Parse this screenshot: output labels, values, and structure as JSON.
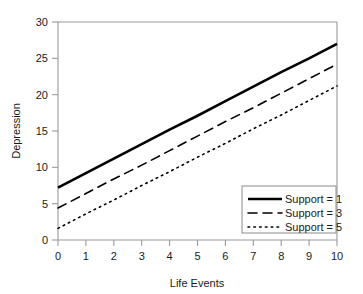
{
  "chart_data": {
    "type": "line",
    "title": "",
    "xlabel": "Life Events",
    "ylabel": "Depression",
    "x": [
      0,
      1,
      2,
      3,
      4,
      5,
      6,
      7,
      8,
      9,
      10
    ],
    "xlim": [
      0,
      10
    ],
    "ylim": [
      0,
      30
    ],
    "xticks": [
      "0",
      "1",
      "2",
      "3",
      "4",
      "5",
      "6",
      "7",
      "8",
      "9",
      "10"
    ],
    "yticks": [
      "0",
      "5",
      "10",
      "15",
      "20",
      "25",
      "30"
    ],
    "grid": false,
    "legend_position": "lower-right",
    "series": [
      {
        "name": "Support = 1",
        "style": "solid",
        "color": "#000000",
        "width": 2.6,
        "values": [
          7.2,
          9.2,
          11.2,
          13.2,
          15.2,
          17.1,
          19.1,
          21.1,
          23.1,
          25.0,
          27.0
        ]
      },
      {
        "name": "Support = 3",
        "style": "dashed",
        "color": "#000000",
        "width": 1.6,
        "values": [
          4.4,
          6.4,
          8.4,
          10.3,
          12.3,
          14.3,
          16.3,
          18.2,
          20.2,
          22.2,
          24.2
        ]
      },
      {
        "name": "Support = 5",
        "style": "dotted",
        "color": "#000000",
        "width": 1.6,
        "values": [
          1.6,
          3.6,
          5.5,
          7.5,
          9.4,
          11.4,
          13.3,
          15.3,
          17.2,
          19.2,
          21.2
        ]
      }
    ]
  },
  "axes": {
    "x_title": "Life Events",
    "y_title": "Depression",
    "x_tick_labels": [
      "0",
      "1",
      "2",
      "3",
      "4",
      "5",
      "6",
      "7",
      "8",
      "9",
      "10"
    ],
    "y_tick_labels": [
      "30",
      "25",
      "20",
      "15",
      "10",
      "5",
      "0"
    ]
  },
  "legend": {
    "entries": [
      {
        "label": "Support = 1",
        "style": "solid"
      },
      {
        "label": "Support = 3",
        "style": "dashed"
      },
      {
        "label": "Support = 5",
        "style": "dotted"
      }
    ]
  },
  "colors": {
    "background": "#ffffff",
    "line": "#000000",
    "axis": "#9a9a9a",
    "legend_border": "#8a8a8a",
    "text": "#1a1a1a"
  }
}
